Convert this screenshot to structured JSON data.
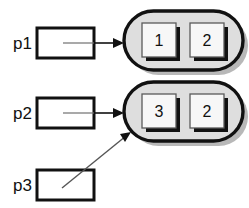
{
  "diagram": {
    "background_color": "#ffffff",
    "pointers": [
      {
        "id": "p1",
        "label": "p1",
        "box_x": 37,
        "box_y": 28,
        "box_w": 57,
        "box_h": 30,
        "target": "node1",
        "link_style": "straight"
      },
      {
        "id": "p2",
        "label": "p2",
        "box_x": 37,
        "box_y": 98,
        "box_w": 57,
        "box_h": 30,
        "target": "node2",
        "link_style": "straight"
      },
      {
        "id": "p3",
        "label": "p3",
        "box_x": 37,
        "box_y": 170,
        "box_w": 57,
        "box_h": 30,
        "target": "node2",
        "link_style": "diagonal"
      }
    ],
    "nodes": [
      {
        "id": "node1",
        "x": 124,
        "y": 11,
        "w": 119,
        "h": 59,
        "fill_color": "#dedede",
        "border_color": "#111111",
        "cells": [
          {
            "value": "1",
            "x": 142,
            "y": 23,
            "w": 34,
            "h": 34
          },
          {
            "value": "2",
            "x": 190,
            "y": 23,
            "w": 34,
            "h": 34
          }
        ]
      },
      {
        "id": "node2",
        "x": 124,
        "y": 82,
        "w": 119,
        "h": 59,
        "fill_color": "#dedede",
        "border_color": "#111111",
        "cells": [
          {
            "value": "3",
            "x": 142,
            "y": 94,
            "w": 34,
            "h": 34
          },
          {
            "value": "2",
            "x": 190,
            "y": 94,
            "w": 34,
            "h": 34
          }
        ]
      }
    ],
    "edges": [
      {
        "id": "edge-p1-node1",
        "from": "p1",
        "to": "node1",
        "type": "arrow-right"
      },
      {
        "id": "edge-p2-node2",
        "from": "p2",
        "to": "node2",
        "type": "arrow-right"
      },
      {
        "id": "edge-p3-node2",
        "from": "p3",
        "to": "node2",
        "type": "arrow-diagonal"
      }
    ],
    "colors": {
      "ink": "#111111",
      "node_fill": "#dedede",
      "cell_fill": "#f7f7f7",
      "shadow": "#111111",
      "node_shadow": "#b8b8b8",
      "link": "#6f6f6f"
    }
  }
}
